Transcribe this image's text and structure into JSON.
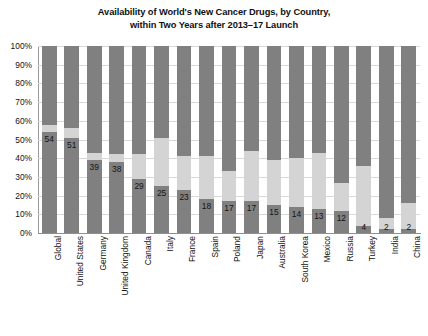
{
  "chart_data": {
    "type": "bar",
    "subtype": "stacked-bar-100",
    "title": "Availability of World's New Cancer Drugs, by Country, within Two Years after 2013–17 Launch",
    "title_line1": "Availability of World's New Cancer Drugs, by Country,",
    "title_line2": "within Two Years after 2013–17 Launch",
    "xlabel": "",
    "ylabel": "",
    "ylim": [
      0,
      100
    ],
    "ytick_labels": [
      "0%",
      "10%",
      "20%",
      "30%",
      "40%",
      "50%",
      "60%",
      "70%",
      "80%",
      "90%",
      "100%"
    ],
    "ytick_values": [
      0,
      10,
      20,
      30,
      40,
      50,
      60,
      70,
      80,
      90,
      100
    ],
    "grid": true,
    "legend": "none",
    "categories": [
      "Global",
      "United States",
      "Germany",
      "United Kingdom",
      "Canada",
      "Italy",
      "France",
      "Spain",
      "Poland",
      "Japan",
      "Australia",
      "South Korea",
      "Mexico",
      "Russia",
      "Turkey",
      "India",
      "China"
    ],
    "series": [
      {
        "name": "Available",
        "color": "#808080",
        "values": [
          54,
          51,
          39,
          38,
          29,
          25,
          23,
          18,
          17,
          17,
          15,
          14,
          13,
          12,
          4,
          2,
          2
        ]
      },
      {
        "name": "Partially available",
        "color": "#d4d4d4",
        "values": [
          4,
          5,
          4,
          4,
          13,
          26,
          18,
          23,
          16,
          27,
          24,
          26,
          30,
          15,
          32,
          6,
          14
        ]
      },
      {
        "name": "Not available",
        "color": "#808080",
        "values": [
          42,
          44,
          57,
          58,
          58,
          49,
          59,
          59,
          67,
          56,
          61,
          60,
          57,
          73,
          64,
          92,
          84
        ]
      }
    ],
    "data_labels": [
      "54",
      "51",
      "39",
      "38",
      "29",
      "25",
      "23",
      "18",
      "17",
      "17",
      "15",
      "14",
      "13",
      "12",
      "4",
      "2",
      "2"
    ]
  }
}
